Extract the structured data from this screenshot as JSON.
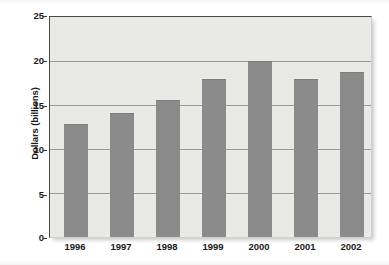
{
  "chart_data": {
    "type": "bar",
    "title": "",
    "xlabel": "",
    "ylabel": "Dollars (billions)",
    "categories": [
      "1996",
      "1997",
      "1998",
      "1999",
      "2000",
      "2001",
      "2002"
    ],
    "values": [
      12.8,
      14.1,
      15.6,
      18.0,
      20.0,
      18.0,
      18.7
    ],
    "series": [
      {
        "name": "Dollars (billions)",
        "values": [
          12.8,
          14.1,
          15.6,
          18.0,
          20.0,
          18.0,
          18.7
        ]
      }
    ],
    "ylim": [
      0,
      25
    ],
    "yticks": [
      0,
      5,
      10,
      15,
      20,
      25
    ],
    "ytick_labels": [
      "0",
      "5",
      "10",
      "15",
      "20",
      "25"
    ],
    "grid": true,
    "gridlines_at": [
      5,
      10,
      15,
      20
    ],
    "legend": false,
    "legend_position": "none",
    "bar_color": "#8b8b8b",
    "plot_background": "#e9e9e6",
    "page_background": "#ffffff",
    "gridline_color": "#9a9a97",
    "axis_color": "#4a4a4a",
    "text_color": "#1a1a1a"
  }
}
